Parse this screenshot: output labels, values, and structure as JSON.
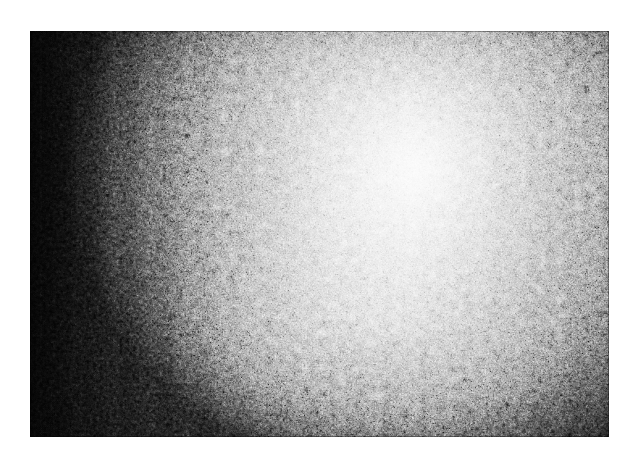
{
  "document": {
    "title": "Grayscale speckle micrograph",
    "background_color": "#ffffff",
    "canvas_width_px": 637,
    "canvas_height_px": 464
  },
  "image_plate": {
    "name": "grayscale-speckle-micrograph",
    "alt_text": "Grayscale granular speckle texture with bright illumination hotspot upper center-right fading to near black at the left edge",
    "left_px": 30,
    "top_px": 31,
    "width_px": 579,
    "height_px": 406,
    "colorspace": "grayscale",
    "texture": "granular speckle / film grain",
    "grain_feature_size_px": 3
  },
  "illumination": {
    "hotspot_x_pct": 68,
    "hotspot_y_pct": 34,
    "secondary_lobe_x_pct": 60,
    "secondary_lobe_y_pct": 70,
    "brightest_value": "#fafafa",
    "darkest_value": "#0d0d0d",
    "left_edge_value": "#101010",
    "right_edge_value": "#8f8f8f",
    "top_edge_value": "#9a9a9a",
    "bottom_edge_value": "#6e6e6e",
    "center_value": "#ededed",
    "gradient_direction": "radial hotspot with strong left-to-right falloff"
  },
  "margins": {
    "top_px": 31,
    "left_px": 30,
    "right_px": 28,
    "bottom_px": 27,
    "color": "#ffffff"
  }
}
